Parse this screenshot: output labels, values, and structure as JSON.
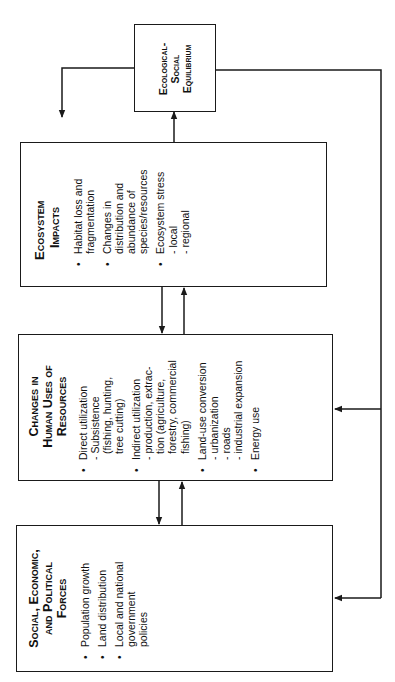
{
  "diagram": {
    "orientation": "rotated 90° counter-clockwise (text reads bottom-to-top)",
    "equilibrium": {
      "title_lines": [
        "Ecological-",
        "Social",
        "Equilibrium"
      ]
    },
    "ecosystem": {
      "title_lines": [
        "Ecosystem",
        "Impacts"
      ],
      "items": [
        {
          "lines": [
            "Habitat loss and",
            "fragmentation"
          ],
          "subs": []
        },
        {
          "lines": [
            "Changes in",
            "distribution and",
            "abundance of",
            "species/resources"
          ],
          "subs": []
        },
        {
          "lines": [
            "Ecosystem stress"
          ],
          "subs": [
            "- local",
            "- regional"
          ]
        }
      ]
    },
    "human_uses": {
      "title_lines": [
        "Changes in",
        "Human Uses of",
        "Resources"
      ],
      "items": [
        {
          "lines": [
            "Direct utilization"
          ],
          "subs": [
            "- Subsistence",
            "(fishing, hunting,",
            "tree cutting)"
          ]
        },
        {
          "lines": [
            "Indirect utilization"
          ],
          "subs": [
            "- production,  extrac-",
            "tion (agriculture,",
            "forestry, commercial",
            "fishing)"
          ]
        },
        {
          "lines": [
            "Land-use conversion"
          ],
          "subs": [
            "- urbanization",
            "- roads",
            "- industrial expansion"
          ]
        },
        {
          "lines": [
            "Energy use"
          ],
          "subs": []
        }
      ]
    },
    "forces": {
      "title_lines": [
        "Social, Economic,",
        "and Political",
        "Forces"
      ],
      "items": [
        {
          "lines": [
            "Population growth"
          ],
          "subs": []
        },
        {
          "lines": [
            "Land distribution"
          ],
          "subs": []
        },
        {
          "lines": [
            "Local and national",
            "government",
            "policies"
          ],
          "subs": []
        }
      ]
    },
    "connections": [
      {
        "from": "forces",
        "to": "human_uses",
        "direction": "bidirectional"
      },
      {
        "from": "human_uses",
        "to": "ecosystem",
        "direction": "bidirectional"
      },
      {
        "from": "ecosystem",
        "to": "equilibrium"
      },
      {
        "from": "equilibrium",
        "to": "ecosystem",
        "route": "feedback loop via left side"
      },
      {
        "from": "equilibrium",
        "to": "human_uses",
        "route": "feedback via right side"
      },
      {
        "from": "equilibrium",
        "to": "forces",
        "route": "feedback via right side"
      }
    ],
    "colors": {
      "line": "#1a1a1a",
      "background": "#ffffff"
    }
  }
}
